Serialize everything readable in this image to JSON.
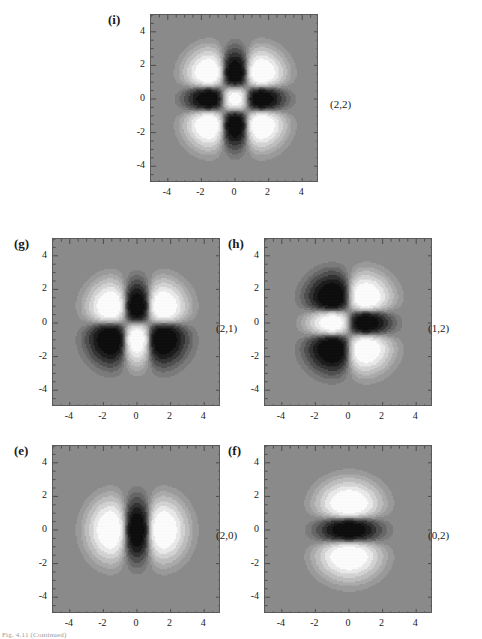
{
  "figure": {
    "caption": "Fig. 4.11   (Continued)",
    "background_color": "#ffffff"
  },
  "axis": {
    "xticks": [
      "-4",
      "-2",
      "0",
      "2",
      "4"
    ],
    "yticks": [
      "4",
      "2",
      "0",
      "-2",
      "-4"
    ],
    "xlim": [
      -5,
      5
    ],
    "ylim": [
      -5,
      5
    ]
  },
  "colors": {
    "field_background": "#8a8a8a",
    "negative_dark": "#0d0d0d",
    "positive_light": "#fbfbfb",
    "frame": "#5a5a5a",
    "band_1": "#9a9a9a",
    "band_2": "#aaaaaa",
    "band_3": "#bdbdbd",
    "band_4": "#d2d2d2",
    "band_5": "#e8e8e8",
    "band_n1": "#7a7a7a",
    "band_n2": "#666666",
    "band_n3": "#4e4e4e",
    "band_n4": "#333333",
    "band_n5": "#1c1c1c"
  },
  "panels": [
    {
      "id": "i",
      "letter": "(i)",
      "mode": "(2,2)",
      "nx": 2,
      "ny": 2,
      "row": 0
    },
    {
      "id": "g",
      "letter": "(g)",
      "mode": "(2,1)",
      "nx": 2,
      "ny": 1,
      "row": 1
    },
    {
      "id": "h",
      "letter": "(h)",
      "mode": "(1,2)",
      "nx": 1,
      "ny": 2,
      "row": 1
    },
    {
      "id": "e",
      "letter": "(e)",
      "mode": "(2,0)",
      "nx": 2,
      "ny": 0,
      "row": 2
    },
    {
      "id": "f",
      "letter": "(f)",
      "mode": "(0,2)",
      "nx": 0,
      "ny": 2,
      "row": 2
    }
  ],
  "chart_data": {
    "type": "heatmap",
    "title": "",
    "xlabel": "",
    "ylabel": "",
    "xlim": [
      -5,
      5
    ],
    "ylim": [
      -5,
      5
    ],
    "grid": false,
    "legend": "none",
    "panels": [
      {
        "label": "(i)",
        "mode": "(2,2)",
        "nx": 2,
        "ny": 2,
        "lobes": 9,
        "lobe_signs": "center positive; four axis lobes negative; four corner lobes positive",
        "nodal_lines_x": [
          -0.707,
          0.707
        ],
        "nodal_lines_y": [
          -0.707,
          0.707
        ]
      },
      {
        "label": "(g)",
        "mode": "(2,1)",
        "nx": 2,
        "ny": 1,
        "lobes": 6,
        "lobe_signs": "upper-center negative, lower-center positive; left/right upper positive, left/right lower negative",
        "nodal_lines_x": [
          -0.707,
          0.707
        ],
        "nodal_lines_y": [
          0
        ]
      },
      {
        "label": "(h)",
        "mode": "(1,2)",
        "nx": 1,
        "ny": 2,
        "lobes": 6,
        "lobe_signs": "left-center positive, right-center negative; upper-left negative, upper-right positive; lower-left negative, lower-right positive",
        "nodal_lines_x": [
          0
        ],
        "nodal_lines_y": [
          -0.707,
          0.707
        ]
      },
      {
        "label": "(e)",
        "mode": "(2,0)",
        "nx": 2,
        "ny": 0,
        "lobes": 3,
        "lobe_signs": "central vertical band negative; left and right lobes positive",
        "nodal_lines_x": [
          -0.707,
          0.707
        ],
        "nodal_lines_y": []
      },
      {
        "label": "(f)",
        "mode": "(0,2)",
        "nx": 0,
        "ny": 2,
        "lobes": 3,
        "lobe_signs": "central horizontal band negative; top and bottom lobes positive",
        "nodal_lines_x": [],
        "nodal_lines_y": [
          -0.707,
          0.707
        ]
      }
    ],
    "contour_levels": [
      -1.0,
      -0.75,
      -0.5,
      -0.3,
      -0.15,
      -0.05,
      0.05,
      0.15,
      0.3,
      0.5,
      0.75,
      1.0
    ]
  }
}
